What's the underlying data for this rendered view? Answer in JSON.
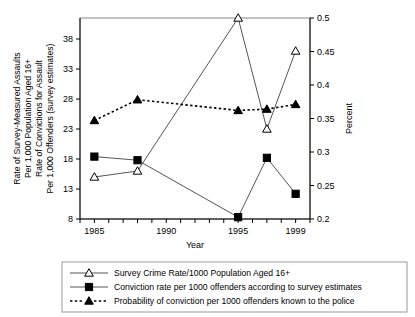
{
  "figure": {
    "background": "#ffffff",
    "ink_color": "#000000",
    "series_line_color": "#555555"
  },
  "axes": {
    "left": {
      "title_lines": [
        "Rate of Survey-Measured Assaults",
        "Per 1,000 Population Aged 16+",
        "Rate of Convictions for Assault",
        "Per 1,000 Offenders (survey estimates)"
      ],
      "ticks": [
        8,
        13,
        18,
        23,
        28,
        33,
        38
      ],
      "range": [
        8,
        41.5
      ]
    },
    "right": {
      "title": "Percent",
      "ticks": [
        "0.2",
        "0.25",
        "0.3",
        "0.35",
        "0.4",
        "0.45",
        "0.5"
      ],
      "range": [
        0.2,
        0.5
      ]
    },
    "bottom": {
      "title": "Year",
      "ticks": [
        "1985",
        "1990",
        "1995",
        "1999"
      ],
      "range": [
        1984,
        2000
      ]
    }
  },
  "legend": {
    "items": [
      {
        "marker": "open-triangle-marker",
        "label": "Survey Crime Rate/1000 Population Aged 16+",
        "style": "solid"
      },
      {
        "marker": "filled-square-marker",
        "label": "Conviction rate per 1000 offenders according to survey estimates",
        "style": "solid"
      },
      {
        "marker": "filled-triangle-marker",
        "label": "Probability of conviction per 1000 offenders known to the police",
        "style": "dotted"
      }
    ]
  },
  "chart_data": {
    "type": "line",
    "title": "",
    "xlabel": "Year",
    "ylabel": "Rate of Survey-Measured Assaults Per 1,000 Population Aged 16+ Rate of Convictions for Assault Per 1,000 Offenders (survey estimates)",
    "y2label": "Percent",
    "xlim": [
      1984,
      2000
    ],
    "ylim": [
      8,
      41.5
    ],
    "y2lim": [
      0.2,
      0.5
    ],
    "grid": false,
    "legend_position": "bottom",
    "series": [
      {
        "name": "Survey Crime Rate/1000 Population Aged 16+",
        "axis": "left",
        "marker": "open-triangle",
        "linestyle": "solid",
        "x": [
          1985,
          1988,
          1995,
          1997,
          1999
        ],
        "values": [
          15.0,
          16.0,
          41.5,
          23.0,
          36.0
        ]
      },
      {
        "name": "Conviction rate per 1000 offenders according to survey estimates",
        "axis": "left",
        "marker": "filled-square",
        "linestyle": "solid",
        "x": [
          1985,
          1988,
          1995,
          1997,
          1999
        ],
        "values": [
          18.4,
          17.8,
          8.3,
          18.2,
          12.2
        ]
      },
      {
        "name": "Probability of conviction per 1000 offenders known to the police",
        "axis": "right",
        "marker": "filled-triangle",
        "linestyle": "dotted",
        "x": [
          1985,
          1988,
          1995,
          1997,
          1999
        ],
        "values": [
          0.347,
          0.378,
          0.362,
          0.364,
          0.371
        ]
      }
    ]
  }
}
